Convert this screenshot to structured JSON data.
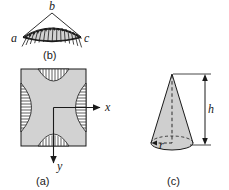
{
  "figure": {
    "caption_a": "(a)",
    "caption_b": "(b)",
    "caption_c": "(c)",
    "colors": {
      "body_fill": "#d2d2d2",
      "cone_fill": "#cfcfcf",
      "wedge_fill": "#d2d2d2",
      "stroke": "#1a1a1a",
      "background": "#ffffff"
    }
  },
  "panel_b": {
    "name": "wedge-with-radial-load",
    "labels": {
      "left_vertex": "a",
      "apex": "b",
      "right_vertex": "c"
    },
    "arc_hatch_count": 15,
    "description": "Triangular wedge a-b-c with arc at base carrying distributed radial load arrows"
  },
  "panel_a": {
    "name": "square-cross-section-with-shear-flow",
    "axes": {
      "x_label": "x",
      "y_label": "y",
      "x_direction": "right",
      "y_direction": "down"
    },
    "hatched_edges": [
      "top",
      "right",
      "bottom",
      "left"
    ],
    "description": "Square cross-section, gray filled, with four hatched lens-shaped stress regions bulging inward from each edge; origin at centre with x to the right and y downward"
  },
  "panel_c": {
    "name": "cone-with-dimensions",
    "labels": {
      "height": "h",
      "radius": "r"
    },
    "dimension_line": "height-arrow-both-ends",
    "centerline": "dashed-vertical",
    "base": "dashed-ellipse-top-solid-front",
    "description": "Right circular cone of height h and base radius r"
  }
}
